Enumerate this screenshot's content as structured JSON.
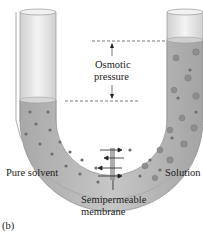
{
  "figure": {
    "panel_label": "(b)",
    "labels": {
      "osmotic_line1": "Osmotic",
      "osmotic_line2": "pressure",
      "pure_solvent": "Pure solvent",
      "solution": "Solution",
      "membrane_line1": "Semipermeable",
      "membrane_line2": "membrane"
    },
    "colors": {
      "tube_glass": "#e4e4e4",
      "liquid": "#b9b9b9",
      "liquid_dark": "#9a9a9a",
      "particle": "#6f6f6f",
      "dashed_line": "#555555"
    }
  }
}
